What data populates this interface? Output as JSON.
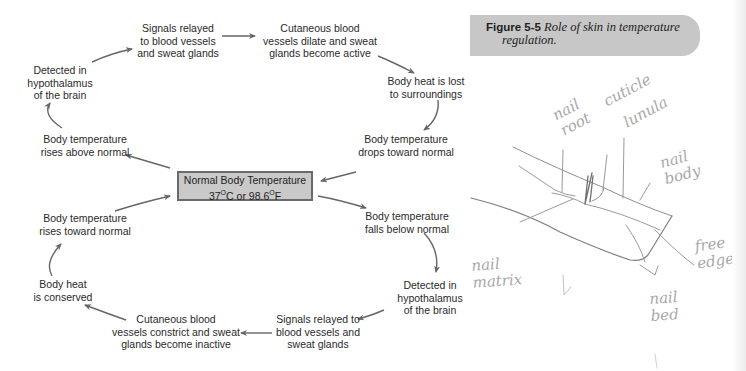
{
  "diagram": {
    "center": {
      "line1": "Normal Body Temperature",
      "temp_c": "37",
      "temp_f": "98.6",
      "unit_c": "C",
      "unit_f": "F",
      "deg": "O",
      "joiner": " or "
    },
    "upper_cycle": [
      {
        "id": "rises-above",
        "text": "Body temperature\nrises above normal"
      },
      {
        "id": "detected-top",
        "text": "Detected in\nhypothalamus\nof the brain"
      },
      {
        "id": "signals-top",
        "text": "Signals relayed\nto blood vessels\nand sweat glands"
      },
      {
        "id": "dilate",
        "text": "Cutaneous blood\nvessels dilate and sweat\nglands become active"
      },
      {
        "id": "heat-lost",
        "text": "Body heat is lost\nto surroundings"
      },
      {
        "id": "drops-toward",
        "text": "Body temperature\ndrops toward normal"
      }
    ],
    "lower_cycle": [
      {
        "id": "falls-below",
        "text": "Body temperature\nfalls below normal"
      },
      {
        "id": "detected-bottom",
        "text": "Detected in\nhypothalamus\nof the brain"
      },
      {
        "id": "signals-bottom",
        "text": "Signals relayed to\nblood vessels and\nsweat glands"
      },
      {
        "id": "constrict",
        "text": "Cutaneous blood\nvessels constrict and sweat\nglands become inactive"
      },
      {
        "id": "heat-conserved",
        "text": "Body heat\nis conserved"
      },
      {
        "id": "rises-toward",
        "text": "Body temperature\nrises toward normal"
      }
    ],
    "colors": {
      "text": "#2a2a2a",
      "arrow": "#666666",
      "center_fill": "#c9c9c9",
      "center_border": "#6a6a6a"
    }
  },
  "caption": {
    "label": "Figure 5-5",
    "text_line1": " Role of skin in temperature",
    "text_line2": "regulation.",
    "background": "#c7c7c7"
  },
  "handwritten_sketch": {
    "subject": "nail anatomy sketch",
    "labels": [
      {
        "id": "nail-root",
        "text": "nail\nroot"
      },
      {
        "id": "cuticle",
        "text": "cuticle"
      },
      {
        "id": "lunula",
        "text": "lunula"
      },
      {
        "id": "nail-body",
        "text": "nail\nbody"
      },
      {
        "id": "free-edge",
        "text": "free\nedge"
      },
      {
        "id": "nail-matrix",
        "text": "nail\nmatrix"
      },
      {
        "id": "nail-bed",
        "text": "nail\nbed"
      }
    ],
    "pencil_color": "#a8a8a8"
  }
}
